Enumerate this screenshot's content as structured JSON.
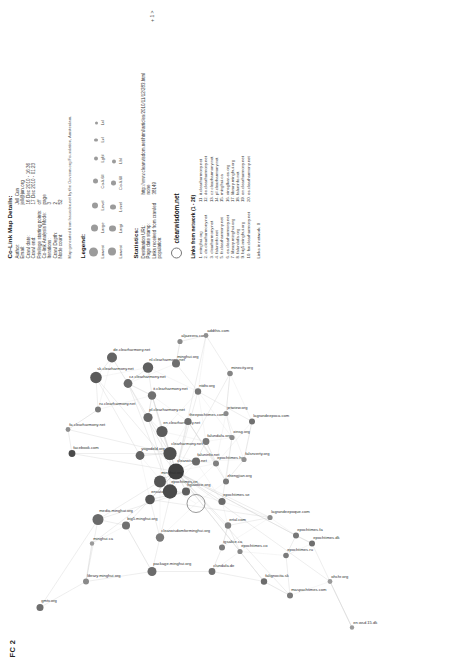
{
  "figure": {
    "caption": "FC 2"
  },
  "details_panel": {
    "title": "Co-Link Map Details:",
    "fields": [
      {
        "key": "Author:",
        "value": "Jell Cun"
      },
      {
        "key": "Email:",
        "value": "jell@jun.org"
      },
      {
        "key": "Crawl date:",
        "value": "16 Dec 2010 - 16:36"
      },
      {
        "key": "Crawl end:",
        "value": "17 Dec 2010 - 01:23"
      },
      {
        "key": "Privilege starting points:",
        "value": "off"
      },
      {
        "key": "Co-link Analysis Mode:",
        "value": "page"
      },
      {
        "key": "Iterations:",
        "value": "3"
      },
      {
        "key": "Crawl Depth:",
        "value": "2"
      },
      {
        "key": "Node count:",
        "value": "52"
      }
    ],
    "note": "Map generated from Issuedex.net by the Govcom.org Foundation, Amsterdam."
  },
  "legend": {
    "title": "Legend:",
    "items": [
      {
        "label": "Lowest",
        "size": 9
      },
      {
        "label": "Large",
        "size": 7
      },
      {
        "label": "Level",
        "size": 6
      },
      {
        "label": "Co-li.6ll",
        "size": 5
      },
      {
        "label": "Lgbl",
        "size": 4
      },
      {
        "label": "Lvl",
        "size": 3.4
      },
      {
        "label": "Lvl",
        "size": 3
      }
    ],
    "row2": [
      {
        "label": "Lowest",
        "size": 8
      },
      {
        "label": "Largi",
        "size": 6.5
      },
      {
        "label": "Level",
        "size": 5.5
      },
      {
        "label": "Co-li.6ll",
        "size": 4.5
      },
      {
        "label": "Lbl",
        "size": 3.8
      }
    ]
  },
  "statistics": {
    "title": "Statistics:",
    "rows": [
      {
        "key": "Destination URL:",
        "value": "http://www.clearwisdom.net/html/articles/2010/11/12/283.html"
      },
      {
        "key": "Page date stamp:",
        "value": "none"
      },
      {
        "key": "Links received from crawled population:",
        "value": "38149"
      }
    ]
  },
  "node_detail": {
    "name": "clearwisdom.net",
    "links_title": "Links from network (1 - 20)",
    "links_left": [
      "1. minghui.org",
      "2. de.clearharmony.net",
      "3. clearharmony.net",
      "4. faluninfo.net",
      "5. fr.clearharmony.net",
      "6. es.clearharmony.net",
      "7. library.minghui.org",
      "8. falundafa.org",
      "9. big5.minghui.org",
      "10. fsv.clearharmony.net"
    ],
    "links_right": [
      "11. it.clearharmony.net",
      "12. de.clearharmony.net",
      "13. cz.clearharmony.net",
      "14. pl.clearharmony.net",
      "15. minghui.ca",
      "16. xinsglkar-es.org",
      "17. library.minghui.org",
      "18. faluninfo.net",
      "19. en.clearharmony.net",
      "20. es.clearharmony.net"
    ],
    "links_in_network": "Links in network: 0",
    "scale_note": "+ 1 >"
  },
  "graph": {
    "type": "co-link network",
    "nodes": [
      {
        "id": "gmtv.org",
        "x": 60,
        "y": 40,
        "r": 3.5,
        "c": "#6f6f6f",
        "label": "gmtv.org"
      },
      {
        "id": "library.minghui.org",
        "x": 86,
        "y": 86,
        "r": 3.0,
        "c": "#8a8a8a",
        "label": "library.minghui.org"
      },
      {
        "id": "minghui.ca",
        "x": 124,
        "y": 92,
        "r": 2.2,
        "c": "#9a9a9a",
        "label": "minghui.ca"
      },
      {
        "id": "media.minghui.org",
        "x": 148,
        "y": 98,
        "r": 5.5,
        "c": "#6a6a6a",
        "label": "media.minghui.org"
      },
      {
        "id": "big5.minghui.org",
        "x": 142,
        "y": 126,
        "r": 4.0,
        "c": "#707070",
        "label": "big5.minghui.org"
      },
      {
        "id": "package.minghui.org",
        "x": 96,
        "y": 152,
        "r": 4.5,
        "c": "#6b6b6b",
        "label": "package.minghui.org"
      },
      {
        "id": "clearwisdomforminghui.org",
        "x": 130,
        "y": 160,
        "r": 4.2,
        "c": "#7a7a7a",
        "label": "clearwisdomforminghui.org"
      },
      {
        "id": "ensata.com",
        "x": 168,
        "y": 150,
        "r": 4.8,
        "c": "#555555",
        "label": "ensata.com"
      },
      {
        "id": "figlaotice.org",
        "x": 176,
        "y": 186,
        "r": 4.0,
        "c": "#5e5e5e",
        "label": "figlaotice.org"
      },
      {
        "id": "clundafa.de",
        "x": 96,
        "y": 212,
        "r": 3.4,
        "c": "#6f6f6f",
        "label": "clundafa.de"
      },
      {
        "id": "igsalice.ca",
        "x": 120,
        "y": 222,
        "r": 3.0,
        "c": "#7d7d7d",
        "label": "igsalice.ca"
      },
      {
        "id": "ertal.com",
        "x": 142,
        "y": 228,
        "r": 3.2,
        "c": "#808080",
        "label": "ertal.com"
      },
      {
        "id": "epochtimes.co",
        "x": 116,
        "y": 240,
        "r": 2.6,
        "c": "#888888",
        "label": "epochtimes.co"
      },
      {
        "id": "falignocita.sk",
        "x": 86,
        "y": 264,
        "r": 3.2,
        "c": "#6c6c6c",
        "label": "falignocita.sk"
      },
      {
        "id": "maspachtimes.com",
        "x": 72,
        "y": 290,
        "r": 3.0,
        "c": "#7a7a7a",
        "label": "maspachtimes.com"
      },
      {
        "id": "epochtimes.ru",
        "x": 112,
        "y": 286,
        "r": 2.8,
        "c": "#7a7a7a",
        "label": "epochtimes.ru"
      },
      {
        "id": "epochtimes.fa",
        "x": 132,
        "y": 296,
        "r": 3.0,
        "c": "#777777",
        "label": "epochtimes.fa"
      },
      {
        "id": "lagrandeepoque.com",
        "x": 150,
        "y": 270,
        "r": 2.6,
        "c": "#8a8a8a",
        "label": "lagrandeepoque.com"
      },
      {
        "id": "epochtimes.dk",
        "x": 124,
        "y": 312,
        "r": 3.0,
        "c": "#6f6f6f",
        "label": "epochtimes.dk"
      },
      {
        "id": "ohchr.org",
        "x": 86,
        "y": 330,
        "r": 2.4,
        "c": "#9b9b9b",
        "label": "ohchr.org"
      },
      {
        "id": "en.wsd.15.dk",
        "x": 40,
        "y": 352,
        "r": 2.2,
        "c": "#9b9b9b",
        "label": "en.wsd.15.dk"
      },
      {
        "id": "facebook.com",
        "x": 214,
        "y": 72,
        "r": 3.4,
        "c": "#4a4a4a",
        "label": "facebook.com"
      },
      {
        "id": "fa.clearharmony.net",
        "x": 238,
        "y": 68,
        "r": 2.4,
        "c": "#8f8f8f",
        "label": "fa.clearharmony.net"
      },
      {
        "id": "ru.clearharmony.net",
        "x": 258,
        "y": 98,
        "r": 3.0,
        "c": "#7a7a7a",
        "label": "ru.clearharmony.net"
      },
      {
        "id": "sk.clearharmony.net",
        "x": 290,
        "y": 96,
        "r": 5.8,
        "c": "#5a5a5a",
        "label": "sk.clearharmony.net"
      },
      {
        "id": "de.clearharmony.net",
        "x": 310,
        "y": 112,
        "r": 5.0,
        "c": "#646464",
        "label": "de.clearharmony.net"
      },
      {
        "id": "cz.clearharmony.net",
        "x": 284,
        "y": 128,
        "r": 4.4,
        "c": "#6a6a6a",
        "label": "cz.clearharmony.net"
      },
      {
        "id": "nl.clearharmony.net",
        "x": 300,
        "y": 148,
        "r": 5.2,
        "c": "#5f5f5f",
        "label": "nl.clearharmony.net"
      },
      {
        "id": "it.clearharmony.net",
        "x": 272,
        "y": 152,
        "r": 4.2,
        "c": "#717171",
        "label": "it.clearharmony.net"
      },
      {
        "id": "pl.clearharmony.net",
        "x": 250,
        "y": 148,
        "r": 4.6,
        "c": "#676767",
        "label": "pl.clearharmony.net"
      },
      {
        "id": "en.clearharmony.net",
        "x": 236,
        "y": 162,
        "r": 5.6,
        "c": "#5b5b5b",
        "label": "en.clearharmony.net"
      },
      {
        "id": "clearharmony.net",
        "x": 214,
        "y": 170,
        "r": 6.6,
        "c": "#4f4f4f",
        "label": "clearharmony.net"
      },
      {
        "id": "clearwisdom.net",
        "x": 196,
        "y": 176,
        "r": 8.0,
        "c": "#3f3f3f",
        "label": "clearwisdom.net"
      },
      {
        "id": "minghui.org",
        "x": 186,
        "y": 160,
        "r": 6.0,
        "c": "#555555",
        "label": "minghui.org"
      },
      {
        "id": "epochtimes.cn",
        "x": 176,
        "y": 170,
        "r": 7.2,
        "c": "#4a4a4a",
        "label": "epochtimes.cn"
      },
      {
        "id": "faluninfo.net",
        "x": 206,
        "y": 196,
        "r": 4.0,
        "c": "#6a6a6a",
        "label": "faluninfo.net"
      },
      {
        "id": "falundafa.org",
        "x": 226,
        "y": 206,
        "r": 3.4,
        "c": "#777777",
        "label": "falundafa.org"
      },
      {
        "id": "epochtimes.hu",
        "x": 204,
        "y": 216,
        "r": 3.0,
        "c": "#7f7f7f",
        "label": "epochtimes.hu"
      },
      {
        "id": "theepochtimes.com",
        "x": 246,
        "y": 188,
        "r": 3.6,
        "c": "#6d6d6d",
        "label": "theepochtimes.com"
      },
      {
        "id": "zhengjian.org",
        "x": 186,
        "y": 226,
        "r": 3.0,
        "c": "#7a7a7a",
        "label": "zhengjian.org"
      },
      {
        "id": "falsnverty.org",
        "x": 208,
        "y": 244,
        "r": 2.6,
        "c": "#909090",
        "label": "falsnverty.org"
      },
      {
        "id": "lagrandeepoca.com",
        "x": 246,
        "y": 252,
        "r": 3.0,
        "c": "#707070",
        "label": "lagrandeepoca.com"
      },
      {
        "id": "ntdtv.org",
        "x": 276,
        "y": 198,
        "r": 3.2,
        "c": "#767676",
        "label": "ntdtv.org"
      },
      {
        "id": "minghui.org.alt",
        "x": 304,
        "y": 176,
        "r": 4.0,
        "c": "#6e6e6e",
        "label": "minghui.org"
      },
      {
        "id": "aljazeera.com",
        "x": 326,
        "y": 180,
        "r": 2.6,
        "c": "#8a8a8a",
        "label": "aljazeera.com"
      },
      {
        "id": "addthis.com",
        "x": 332,
        "y": 206,
        "r": 2.4,
        "c": "#8f8f8f",
        "label": "addthis.com"
      },
      {
        "id": "minecity.org",
        "x": 294,
        "y": 230,
        "r": 2.8,
        "c": "#848484",
        "label": "minecity.org"
      },
      {
        "id": "jetwiew.org",
        "x": 254,
        "y": 226,
        "r": 2.6,
        "c": "#8b8b8b",
        "label": "jetwiew.org"
      },
      {
        "id": "xinsg.org",
        "x": 230,
        "y": 232,
        "r": 2.6,
        "c": "#8b8b8b",
        "label": "xinsg.org"
      },
      {
        "id": "epochtimes.se",
        "x": 166,
        "y": 222,
        "r": 3.6,
        "c": "#6b6b6b",
        "label": "epochtimes.se"
      },
      {
        "id": "yogodeld.org",
        "x": 212,
        "y": 140,
        "r": 4.4,
        "c": "#636363",
        "label": "yogodeld.org"
      },
      {
        "id": "highlight-ring",
        "x": 164,
        "y": 196,
        "r": 9.0,
        "c": "none",
        "label": ""
      }
    ],
    "edges": [
      [
        0,
        1
      ],
      [
        1,
        2
      ],
      [
        1,
        3
      ],
      [
        3,
        4
      ],
      [
        4,
        5
      ],
      [
        5,
        6
      ],
      [
        6,
        7
      ],
      [
        7,
        8
      ],
      [
        1,
        5
      ],
      [
        0,
        3
      ],
      [
        2,
        7
      ],
      [
        3,
        8
      ],
      [
        5,
        9
      ],
      [
        9,
        10
      ],
      [
        10,
        11
      ],
      [
        11,
        12
      ],
      [
        12,
        13
      ],
      [
        13,
        14
      ],
      [
        14,
        15
      ],
      [
        15,
        16
      ],
      [
        16,
        18
      ],
      [
        18,
        19
      ],
      [
        19,
        20
      ],
      [
        9,
        13
      ],
      [
        11,
        17
      ],
      [
        17,
        7
      ],
      [
        8,
        32
      ],
      [
        21,
        22
      ],
      [
        22,
        23
      ],
      [
        23,
        24
      ],
      [
        24,
        25
      ],
      [
        25,
        26
      ],
      [
        26,
        27
      ],
      [
        27,
        28
      ],
      [
        28,
        29
      ],
      [
        29,
        30
      ],
      [
        30,
        31
      ],
      [
        31,
        32
      ],
      [
        32,
        33
      ],
      [
        33,
        34
      ],
      [
        34,
        31
      ],
      [
        32,
        35
      ],
      [
        35,
        36
      ],
      [
        36,
        37
      ],
      [
        37,
        38
      ],
      [
        38,
        39
      ],
      [
        39,
        40
      ],
      [
        40,
        41
      ],
      [
        41,
        42
      ],
      [
        42,
        43
      ],
      [
        43,
        44
      ],
      [
        44,
        45
      ],
      [
        45,
        46
      ],
      [
        46,
        47
      ],
      [
        47,
        48
      ],
      [
        48,
        49
      ],
      [
        49,
        32
      ],
      [
        50,
        31
      ],
      [
        50,
        24
      ],
      [
        32,
        24
      ],
      [
        32,
        26
      ],
      [
        32,
        28
      ],
      [
        32,
        38
      ],
      [
        32,
        42
      ],
      [
        32,
        7
      ],
      [
        32,
        3
      ],
      [
        32,
        16
      ],
      [
        31,
        30
      ],
      [
        31,
        28
      ],
      [
        31,
        26
      ],
      [
        31,
        22
      ],
      [
        34,
        29
      ],
      [
        34,
        26
      ],
      [
        30,
        28
      ],
      [
        28,
        26
      ],
      [
        7,
        32
      ],
      [
        6,
        32
      ],
      [
        4,
        32
      ],
      [
        16,
        32
      ],
      [
        14,
        32
      ],
      [
        13,
        32
      ],
      [
        12,
        32
      ],
      [
        11,
        32
      ],
      [
        21,
        31
      ],
      [
        21,
        32
      ],
      [
        19,
        32
      ],
      [
        18,
        16
      ],
      [
        20,
        19
      ],
      [
        17,
        32
      ],
      [
        45,
        32
      ],
      [
        46,
        32
      ]
    ]
  }
}
